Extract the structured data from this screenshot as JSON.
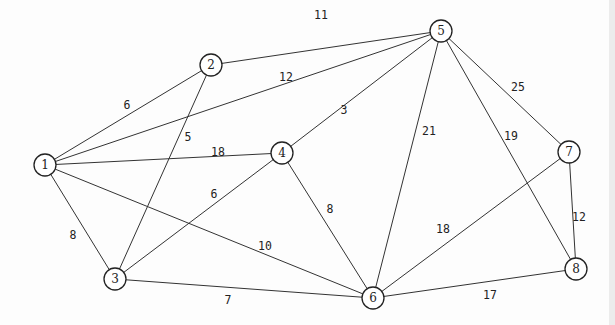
{
  "nodes": [
    {
      "id": "1",
      "label": "1",
      "x": 45,
      "y": 165
    },
    {
      "id": "2",
      "label": "2",
      "x": 211,
      "y": 65
    },
    {
      "id": "3",
      "label": "3",
      "x": 115,
      "y": 279
    },
    {
      "id": "4",
      "label": "4",
      "x": 282,
      "y": 153
    },
    {
      "id": "5",
      "label": "5",
      "x": 441,
      "y": 31
    },
    {
      "id": "6",
      "label": "6",
      "x": 373,
      "y": 298
    },
    {
      "id": "7",
      "label": "7",
      "x": 569,
      "y": 152
    },
    {
      "id": "8",
      "label": "8",
      "x": 576,
      "y": 269
    }
  ],
  "edges": [
    {
      "from": "1",
      "to": "2",
      "weight": "6",
      "lx": 127,
      "ly": 105
    },
    {
      "from": "2",
      "to": "5",
      "weight": "11",
      "lx": 321,
      "ly": 15
    },
    {
      "from": "1",
      "to": "5",
      "weight": "12",
      "lx": 286,
      "ly": 77
    },
    {
      "from": "2",
      "to": "3",
      "weight": "5",
      "lx": 188,
      "ly": 137
    },
    {
      "from": "1",
      "to": "4",
      "weight": "18",
      "lx": 218,
      "ly": 152
    },
    {
      "from": "4",
      "to": "5",
      "weight": "3",
      "lx": 344,
      "ly": 110
    },
    {
      "from": "1",
      "to": "3",
      "weight": "8",
      "lx": 73,
      "ly": 235
    },
    {
      "from": "1",
      "to": "6",
      "weight": "10",
      "lx": 265,
      "ly": 246
    },
    {
      "from": "3",
      "to": "4",
      "weight": "6",
      "lx": 214,
      "ly": 194
    },
    {
      "from": "3",
      "to": "6",
      "weight": "7",
      "lx": 228,
      "ly": 300
    },
    {
      "from": "4",
      "to": "6",
      "weight": "8",
      "lx": 330,
      "ly": 209
    },
    {
      "from": "5",
      "to": "6",
      "weight": "21",
      "lx": 429,
      "ly": 131
    },
    {
      "from": "5",
      "to": "8",
      "weight": "19",
      "lx": 511,
      "ly": 136
    },
    {
      "from": "5",
      "to": "7",
      "weight": "25",
      "lx": 518,
      "ly": 87
    },
    {
      "from": "6",
      "to": "7",
      "weight": "18",
      "lx": 443,
      "ly": 229
    },
    {
      "from": "7",
      "to": "8",
      "weight": "12",
      "lx": 579,
      "ly": 217
    },
    {
      "from": "6",
      "to": "8",
      "weight": "17",
      "lx": 490,
      "ly": 295
    }
  ]
}
